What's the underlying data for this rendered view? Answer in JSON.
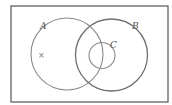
{
  "diagram": {
    "type": "venn",
    "universe": {
      "x": 11,
      "y": 6,
      "width": 157,
      "height": 96,
      "stroke": "#555555"
    },
    "sets": [
      {
        "id": "A",
        "label": "A",
        "cx": 67,
        "cy": 54,
        "r": 36,
        "label_x": 40,
        "label_y": 29,
        "stroke": "#8a8a8a"
      },
      {
        "id": "B",
        "label": "B",
        "cx": 111.5,
        "cy": 55,
        "r": 36,
        "label_x": 132,
        "label_y": 29,
        "stroke": "#6f6f6f"
      },
      {
        "id": "C",
        "label": "C",
        "cx": 102,
        "cy": 55.5,
        "r": 13,
        "label_x": 110,
        "label_y": 48,
        "stroke": "#8a8a8a"
      }
    ],
    "marker": {
      "symbol": "×",
      "x": 38,
      "y": 58
    }
  }
}
